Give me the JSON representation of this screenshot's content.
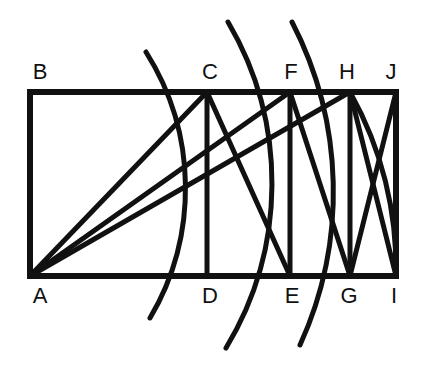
{
  "figure": {
    "background_color": "#ffffff",
    "stroke_color": "#111111",
    "stroke_width": 5,
    "canvas": {
      "width": 424,
      "height": 368
    }
  },
  "points": {
    "A": {
      "label": "A",
      "x": 30,
      "y": 276,
      "label_x": 40,
      "label_y": 303
    },
    "B": {
      "label": "B",
      "x": 30,
      "y": 92,
      "label_x": 40,
      "label_y": 79
    },
    "C": {
      "label": "C",
      "x": 207,
      "y": 92,
      "label_x": 210,
      "label_y": 79
    },
    "D": {
      "label": "D",
      "x": 207,
      "y": 276,
      "label_x": 210,
      "label_y": 303
    },
    "E": {
      "label": "E",
      "x": 290,
      "y": 276,
      "label_x": 292,
      "label_y": 303
    },
    "F": {
      "label": "F",
      "x": 290,
      "y": 92,
      "label_x": 291,
      "label_y": 79
    },
    "G": {
      "label": "G",
      "x": 350,
      "y": 276,
      "label_x": 349,
      "label_y": 303
    },
    "H": {
      "label": "H",
      "x": 350,
      "y": 92,
      "label_x": 347,
      "label_y": 79
    },
    "I": {
      "label": "I",
      "x": 396,
      "y": 276,
      "label_x": 394,
      "label_y": 303
    },
    "J": {
      "label": "J",
      "x": 396,
      "y": 92,
      "label_x": 391,
      "label_y": 79
    }
  },
  "rectangle": {
    "name": "ABJI",
    "x": 30,
    "y": 92,
    "width": 366,
    "height": 184
  },
  "vertical_lines": [
    {
      "name": "CD",
      "x": 207,
      "y1": 92,
      "y2": 276
    },
    {
      "name": "FE",
      "x": 290,
      "y1": 92,
      "y2": 276
    },
    {
      "name": "HG",
      "x": 350,
      "y1": 92,
      "y2": 276
    }
  ],
  "diagonals": [
    {
      "name": "AC",
      "x1": 30,
      "y1": 276,
      "x2": 207,
      "y2": 92
    },
    {
      "name": "AF",
      "x1": 30,
      "y1": 276,
      "x2": 290,
      "y2": 92
    },
    {
      "name": "AH",
      "x1": 30,
      "y1": 276,
      "x2": 350,
      "y2": 92
    },
    {
      "name": "CE",
      "x1": 207,
      "y1": 92,
      "x2": 290,
      "y2": 276
    },
    {
      "name": "FG",
      "x1": 290,
      "y1": 92,
      "x2": 350,
      "y2": 276
    },
    {
      "name": "HI",
      "x1": 350,
      "y1": 92,
      "x2": 396,
      "y2": 276
    },
    {
      "name": "JG",
      "x1": 396,
      "y1": 92,
      "x2": 350,
      "y2": 276
    }
  ],
  "arcs": [
    {
      "name": "arc-radius-AC",
      "center": "A",
      "radius": 255,
      "through": "C",
      "start_x": 146,
      "start_y": 52,
      "end_x": 150,
      "end_y": 318
    },
    {
      "name": "arc-radius-AF",
      "center": "A",
      "radius": 318,
      "through": "F",
      "start_x": 228,
      "start_y": 22,
      "end_x": 226,
      "end_y": 348
    },
    {
      "name": "arc-radius-AH",
      "center": "A",
      "radius": 369,
      "through": "H",
      "start_x": 292,
      "start_y": 22,
      "end_x": 300,
      "end_y": 345
    },
    {
      "name": "arc-radius-AI",
      "center": "A",
      "radius": 366,
      "through": "I",
      "start_x": 350,
      "start_y": 92,
      "end_x": 396,
      "end_y": 276
    }
  ],
  "labels_order": [
    "B",
    "C",
    "F",
    "H",
    "J",
    "A",
    "D",
    "E",
    "G",
    "I"
  ]
}
